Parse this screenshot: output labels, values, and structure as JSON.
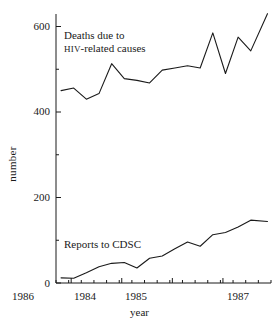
{
  "chart_data": {
    "type": "line",
    "title": "",
    "xlabel": "year",
    "ylabel": "number",
    "xlim": [
      1983.7,
      1987.95
    ],
    "ylim": [
      0,
      640
    ],
    "grid": false,
    "legend_position": "inline-annotations",
    "y_major_ticks": [
      0,
      200,
      400,
      600
    ],
    "y_minor_ticks": [
      100,
      300,
      500
    ],
    "x_major_ticks": [
      1984,
      1985,
      1986,
      1987
    ],
    "x_tick_labels": [
      "1984",
      "1985",
      "1986",
      "1987"
    ],
    "x_minor_tick_interval": 0.25,
    "series": [
      {
        "name": "Deaths due to HIV-related causes",
        "color": "#1a1a1a",
        "x": [
          1983.8,
          1984.05,
          1984.3,
          1984.55,
          1984.8,
          1985.05,
          1985.3,
          1985.55,
          1985.8,
          1986.05,
          1986.3,
          1986.55,
          1986.8,
          1987.05,
          1987.3,
          1987.55,
          1987.88
        ],
        "y": [
          450,
          456,
          430,
          443,
          513,
          478,
          474,
          468,
          498,
          503,
          508,
          503,
          585,
          490,
          575,
          543,
          630
        ]
      },
      {
        "name": "Reports to CDSC",
        "color": "#1a1a1a",
        "x": [
          1983.8,
          1984.05,
          1984.3,
          1984.55,
          1984.8,
          1985.05,
          1985.3,
          1985.55,
          1985.8,
          1986.05,
          1986.3,
          1986.55,
          1986.8,
          1987.05,
          1987.3,
          1987.55,
          1987.88
        ],
        "y": [
          12,
          11,
          24,
          38,
          46,
          48,
          35,
          58,
          63,
          80,
          96,
          86,
          113,
          118,
          131,
          147,
          144
        ]
      }
    ],
    "annotations": [
      {
        "id": "upper-label",
        "line1": "Deaths due to",
        "line2_small_caps": "HIV",
        "line2_rest": "-related causes"
      },
      {
        "id": "lower-label",
        "text": "Reports to CDSC"
      }
    ]
  }
}
